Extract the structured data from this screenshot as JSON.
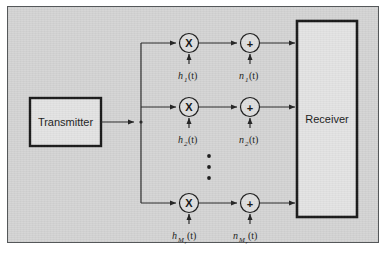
{
  "figure": {
    "background_color": "#d5d5d5",
    "page_color": "#ffffff",
    "border_color": "#55585a",
    "line_color": "#2a2a2a",
    "box_fill": "#e4e4e4"
  },
  "blocks": {
    "transmitter": {
      "label": "Transmitter"
    },
    "receiver": {
      "label": "Receiver"
    }
  },
  "operators": {
    "multiply_symbol": "X",
    "add_symbol": "+",
    "multiply_icon_name": "multiplier-circle-icon",
    "add_icon_name": "adder-circle-icon"
  },
  "branches": [
    {
      "index": 1,
      "channel_label": {
        "base": "h",
        "sub": "1",
        "arg": "(t)",
        "full": "h₁(t)"
      },
      "noise_label": {
        "base": "n",
        "sub": "1",
        "arg": "(t)",
        "full": "n₁(t)"
      }
    },
    {
      "index": 2,
      "channel_label": {
        "base": "h",
        "sub": "2",
        "arg": "(t)",
        "full": "h₂(t)"
      },
      "noise_label": {
        "base": "n",
        "sub": "2",
        "arg": "(t)",
        "full": "n₂(t)"
      }
    },
    {
      "index": 3,
      "channel_label": {
        "base": "h",
        "sub": "M",
        "sub2": "r",
        "arg": "(t)",
        "full": "h_{M_r}(t)"
      },
      "noise_label": {
        "base": "n",
        "sub": "M",
        "sub2": "r",
        "arg": "(t)",
        "full": "n_{M_r}(t)"
      }
    }
  ],
  "ellipsis": {
    "name": "vertical-ellipsis",
    "dot_count": 3
  }
}
